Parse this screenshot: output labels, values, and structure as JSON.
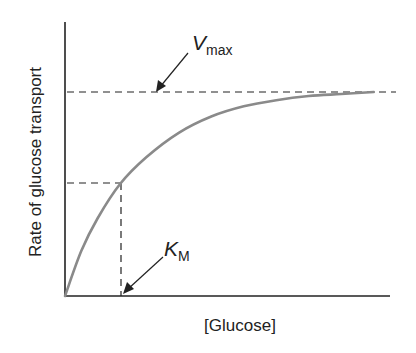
{
  "chart_data": {
    "type": "line",
    "title": "",
    "xlabel": "[Glucose]",
    "ylabel": "Rate of glucose transport",
    "grid": false,
    "legend": null,
    "xlim": [
      0,
      1
    ],
    "ylim": [
      0,
      1.15
    ],
    "series": [
      {
        "name": "Glucose transport rate (saturation curve)",
        "x": [
          0,
          0.05,
          0.1,
          0.17,
          0.25,
          0.35,
          0.45,
          0.55,
          0.65,
          0.75,
          0.85,
          0.95
        ],
        "y": [
          0,
          0.22,
          0.38,
          0.55,
          0.68,
          0.8,
          0.88,
          0.93,
          0.96,
          0.98,
          0.99,
          1.0
        ]
      }
    ],
    "annotations": [
      {
        "label": "V",
        "subscript": "max",
        "type": "horizontal-dashed",
        "y": 1.0,
        "description": "Maximum transport rate"
      },
      {
        "label": "K",
        "subscript": "M",
        "type": "vertical-dashed",
        "x": 0.17,
        "y": 0.55,
        "description": "Glucose concentration at half-maximal rate"
      }
    ],
    "colors": {
      "curve": "#8a8a8a",
      "axes": "#222222"
    }
  }
}
